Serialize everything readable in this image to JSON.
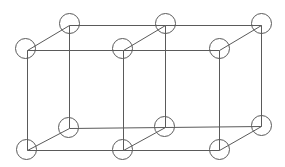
{
  "diagram": {
    "type": "lattice",
    "colors": {
      "stroke": "#5a5a5a",
      "background": "#ffffff"
    },
    "node_radius": 10,
    "nodes": [
      {
        "id": "ft0",
        "cx": 25,
        "cy": 48,
        "jx": 27,
        "jy": 50
      },
      {
        "id": "ft1",
        "cx": 122,
        "cy": 48,
        "jx": 123,
        "jy": 50
      },
      {
        "id": "ft2",
        "cx": 219,
        "cy": 48,
        "jx": 219,
        "jy": 50
      },
      {
        "id": "bt0",
        "cx": 69,
        "cy": 23,
        "jx": 69,
        "jy": 25
      },
      {
        "id": "bt1",
        "cx": 165,
        "cy": 23,
        "jx": 165,
        "jy": 25
      },
      {
        "id": "bt2",
        "cx": 261,
        "cy": 23,
        "jx": 261,
        "jy": 25
      },
      {
        "id": "fb0",
        "cx": 26,
        "cy": 149,
        "jx": 27,
        "jy": 150
      },
      {
        "id": "fb1",
        "cx": 122,
        "cy": 149,
        "jx": 123,
        "jy": 150
      },
      {
        "id": "fb2",
        "cx": 219,
        "cy": 149,
        "jx": 219,
        "jy": 150
      },
      {
        "id": "bb0",
        "cx": 68,
        "cy": 127,
        "jx": 69,
        "jy": 128
      },
      {
        "id": "bb1",
        "cx": 164,
        "cy": 126,
        "jx": 165,
        "jy": 127
      },
      {
        "id": "bb2",
        "cx": 261,
        "cy": 125,
        "jx": 261,
        "jy": 126
      }
    ],
    "edges": [
      [
        "ft0",
        "ft1"
      ],
      [
        "ft1",
        "ft2"
      ],
      [
        "bt0",
        "bt1"
      ],
      [
        "bt1",
        "bt2"
      ],
      [
        "fb0",
        "fb1"
      ],
      [
        "fb1",
        "fb2"
      ],
      [
        "bb0",
        "bb1"
      ],
      [
        "bb1",
        "bb2"
      ],
      [
        "ft0",
        "bt0"
      ],
      [
        "ft1",
        "bt1"
      ],
      [
        "ft2",
        "bt2"
      ],
      [
        "fb0",
        "bb0"
      ],
      [
        "fb1",
        "bb1"
      ],
      [
        "fb2",
        "bb2"
      ],
      [
        "ft0",
        "fb0"
      ],
      [
        "ft1",
        "fb1"
      ],
      [
        "ft2",
        "fb2"
      ],
      [
        "bt0",
        "bb0"
      ],
      [
        "bt1",
        "bb1"
      ],
      [
        "bt2",
        "bb2"
      ]
    ]
  }
}
